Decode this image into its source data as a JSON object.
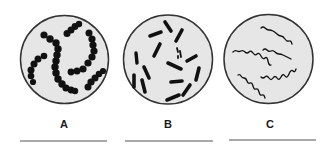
{
  "colors": {
    "background": "#ffffff",
    "circle_fill": "#e6e6e6",
    "circle_stroke": "#333333",
    "organism": "#111111",
    "answer_line": "#555555"
  },
  "panels": [
    {
      "id": "A",
      "label": "A",
      "morphology": "cocci-in-chains",
      "cx": 64.5,
      "cy": 59.5,
      "r": 44,
      "label_x": 64,
      "label_y": 128,
      "line": {
        "x1": 20,
        "x2": 107,
        "y": 141
      }
    },
    {
      "id": "B",
      "label": "B",
      "morphology": "bacilli-rods",
      "cx": 168,
      "cy": 59.5,
      "r": 44.5,
      "label_x": 168,
      "label_y": 128,
      "line": {
        "x1": 125,
        "x2": 213,
        "y": 141
      }
    },
    {
      "id": "C",
      "label": "C",
      "morphology": "spirilla-spirochetes",
      "cx": 268.5,
      "cy": 59,
      "r": 44.5,
      "label_x": 270,
      "label_y": 128,
      "line": {
        "x1": 229,
        "x2": 316,
        "y": 140
      }
    }
  ]
}
